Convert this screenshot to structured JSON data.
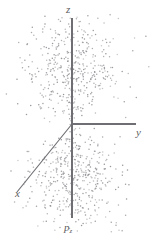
{
  "figure": {
    "name": "pz-orbital-electron-density-scatter",
    "background_color": "#ffffff",
    "width": 154,
    "height": 242
  },
  "labels": {
    "z_axis": "z",
    "y_axis": "y",
    "x_axis": "x",
    "orbital": "p",
    "orbital_subscript": "z"
  },
  "colors": {
    "axis": "#6e6e73",
    "point": "#8e8e93",
    "label": "#5d5d61"
  },
  "chart_data": {
    "type": "scatter",
    "title": "",
    "subtitle": "",
    "xlabel": "x",
    "ylabel": "y",
    "zlabel": "z",
    "annotations": [
      "p_z"
    ],
    "legend": [],
    "grid": false,
    "axes": [
      {
        "name": "z",
        "label": "z",
        "orientation": "vertical",
        "from": [
          72,
          218
        ],
        "to": [
          72,
          18
        ],
        "label_at": [
          70,
          10
        ]
      },
      {
        "name": "y",
        "label": "y",
        "orientation": "horizontal-right",
        "from": [
          72,
          124
        ],
        "to": [
          136,
          124
        ],
        "label_at": [
          140,
          132
        ]
      },
      {
        "name": "x",
        "label": "x",
        "orientation": "diagonal-lower-left",
        "from": [
          72,
          124
        ],
        "to": [
          17,
          192
        ],
        "label_at": [
          22,
          194
        ]
      }
    ],
    "origin": [
      72,
      124
    ],
    "point_count": 900,
    "point_radius": 0.75,
    "point_opacity": 0.75,
    "distribution": {
      "model": "hydrogenic-2pz-probability-cloud",
      "lobes": 2,
      "lobe_axis": "z",
      "upper_lobe_center": [
        72,
        74
      ],
      "lower_lobe_center": [
        72,
        174
      ],
      "spread_x": 26,
      "spread_z": 30,
      "node_plane": "z = 0"
    },
    "xlim": [
      -40,
      40
    ],
    "ylim": [
      -40,
      40
    ],
    "zlim": [
      -55,
      55
    ]
  }
}
